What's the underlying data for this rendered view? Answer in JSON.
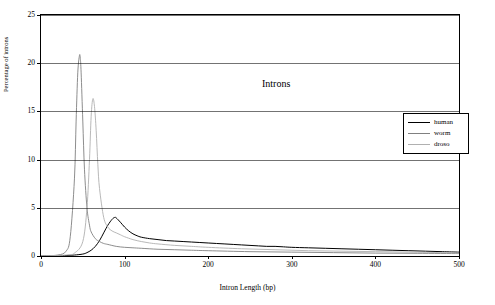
{
  "chart": {
    "title": "Introns",
    "xlabel": "Intron Length (bp)",
    "ylabel": "Percentage of introns"
  },
  "legend": {
    "items": [
      {
        "label": "human",
        "color": "#000000"
      },
      {
        "label": "worm",
        "color": "#808080"
      },
      {
        "label": "droso",
        "color": "#b0b0b0"
      }
    ]
  },
  "chart_data": {
    "type": "line",
    "title": "Introns",
    "xlabel": "Intron Length (bp)",
    "ylabel": "Percentage of introns",
    "xlim": [
      0,
      500
    ],
    "ylim": [
      0,
      25
    ],
    "xticks": [
      0,
      100,
      200,
      300,
      400,
      500
    ],
    "yticks": [
      0,
      5,
      10,
      15,
      20,
      25
    ],
    "grid": true,
    "legend_position": "right",
    "series": [
      {
        "name": "human",
        "color": "#000000",
        "x": [
          0,
          20,
          30,
          40,
          50,
          55,
          60,
          65,
          70,
          75,
          80,
          85,
          88,
          90,
          95,
          100,
          105,
          110,
          115,
          120,
          130,
          140,
          150,
          160,
          170,
          180,
          190,
          200,
          210,
          220,
          230,
          240,
          250,
          260,
          270,
          280,
          290,
          300,
          320,
          340,
          360,
          380,
          400,
          420,
          440,
          460,
          480,
          500
        ],
        "y": [
          0,
          0,
          0.05,
          0.1,
          0.2,
          0.35,
          0.6,
          1.0,
          1.6,
          2.4,
          3.2,
          3.8,
          4.0,
          3.95,
          3.5,
          3.0,
          2.6,
          2.3,
          2.1,
          1.95,
          1.8,
          1.7,
          1.6,
          1.55,
          1.5,
          1.45,
          1.4,
          1.35,
          1.3,
          1.25,
          1.2,
          1.15,
          1.1,
          1.05,
          1.0,
          1.0,
          0.95,
          0.9,
          0.85,
          0.8,
          0.75,
          0.7,
          0.65,
          0.6,
          0.55,
          0.5,
          0.45,
          0.4
        ]
      },
      {
        "name": "worm",
        "color": "#808080",
        "x": [
          0,
          20,
          30,
          35,
          40,
          42,
          44,
          46,
          47,
          48,
          50,
          52,
          55,
          58,
          60,
          65,
          70,
          75,
          80,
          90,
          100,
          110,
          120,
          140,
          160,
          180,
          200,
          250,
          300,
          350,
          400,
          450,
          500
        ],
        "y": [
          0,
          0.1,
          0.5,
          2.0,
          8.0,
          14.0,
          19.0,
          20.8,
          20.5,
          19.0,
          14.0,
          9.0,
          5.0,
          3.2,
          2.5,
          1.8,
          1.5,
          1.3,
          1.2,
          1.0,
          0.9,
          0.85,
          0.8,
          0.7,
          0.65,
          0.6,
          0.55,
          0.45,
          0.4,
          0.35,
          0.3,
          0.28,
          0.25
        ]
      },
      {
        "name": "droso",
        "color": "#b0b0b0",
        "x": [
          0,
          30,
          40,
          50,
          55,
          58,
          60,
          62,
          64,
          66,
          68,
          70,
          75,
          80,
          85,
          90,
          95,
          100,
          110,
          120,
          130,
          140,
          160,
          180,
          200,
          240,
          280,
          320,
          360,
          400,
          440,
          480,
          500
        ],
        "y": [
          0,
          0.1,
          0.3,
          1.5,
          5.0,
          10.0,
          14.5,
          16.3,
          15.5,
          13.0,
          9.5,
          7.0,
          4.0,
          3.0,
          2.6,
          2.4,
          2.2,
          2.0,
          1.7,
          1.5,
          1.35,
          1.25,
          1.1,
          1.0,
          0.9,
          0.75,
          0.65,
          0.55,
          0.5,
          0.45,
          0.4,
          0.35,
          0.3
        ]
      }
    ]
  }
}
